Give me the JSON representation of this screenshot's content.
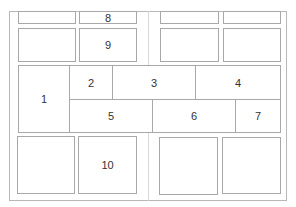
{
  "diagram": {
    "type": "layout-grid",
    "regions": [
      {
        "id": "top-left-a",
        "label": ""
      },
      {
        "id": "8",
        "label": "8"
      },
      {
        "id": "top-right-a",
        "label": ""
      },
      {
        "id": "top-right-b",
        "label": ""
      },
      {
        "id": "row2-left",
        "label": ""
      },
      {
        "id": "9",
        "label": "9"
      },
      {
        "id": "row2-right-a",
        "label": ""
      },
      {
        "id": "row2-right-b",
        "label": ""
      },
      {
        "id": "1",
        "label": "1"
      },
      {
        "id": "2",
        "label": "2"
      },
      {
        "id": "3",
        "label": "3"
      },
      {
        "id": "4",
        "label": "4"
      },
      {
        "id": "5",
        "label": "5"
      },
      {
        "id": "6",
        "label": "6"
      },
      {
        "id": "7",
        "label": "7"
      },
      {
        "id": "bottom-left",
        "label": ""
      },
      {
        "id": "10",
        "label": "10"
      },
      {
        "id": "bottom-right-a",
        "label": ""
      },
      {
        "id": "bottom-right-b",
        "label": ""
      }
    ]
  }
}
